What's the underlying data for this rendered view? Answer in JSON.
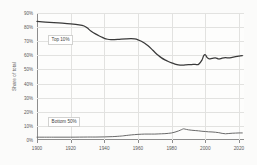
{
  "chart_data": {
    "type": "line",
    "title": "",
    "subtitle": "",
    "xlabel": "",
    "ylabel": "Share of total",
    "xlim": [
      1900,
      2023
    ],
    "ylim": [
      0,
      90
    ],
    "grid": true,
    "legend_position": "inline-annotation",
    "x_ticks": [
      "1900",
      "1920",
      "1940",
      "1960",
      "1980",
      "2000",
      "2020"
    ],
    "x_tick_values": [
      1900,
      1920,
      1940,
      1960,
      1980,
      2000,
      2020
    ],
    "y_ticks": [
      "0%",
      "10%",
      "20%",
      "30%",
      "40%",
      "50%",
      "60%",
      "70%",
      "80%",
      "90%"
    ],
    "y_tick_values": [
      0,
      10,
      20,
      30,
      40,
      50,
      60,
      70,
      80,
      90
    ],
    "annotations": [
      {
        "text": "Top 10%",
        "series": "Top 10%"
      },
      {
        "text": "Bottom 50%",
        "series": "Bottom 50%"
      }
    ],
    "series": [
      {
        "name": "Top 10%",
        "color": "#3a3a3a",
        "x": [
          1900,
          1905,
          1910,
          1915,
          1920,
          1925,
          1928,
          1930,
          1932,
          1935,
          1938,
          1940,
          1942,
          1944,
          1946,
          1948,
          1950,
          1953,
          1956,
          1958,
          1960,
          1962,
          1964,
          1966,
          1968,
          1970,
          1972,
          1974,
          1976,
          1978,
          1980,
          1982,
          1984,
          1986,
          1988,
          1990,
          1992,
          1994,
          1996,
          1998,
          1999,
          2000,
          2001,
          2002,
          2004,
          2006,
          2008,
          2010,
          2012,
          2014,
          2016,
          2018,
          2020,
          2022
        ],
        "values": [
          84.0,
          83.6,
          83.2,
          82.8,
          82.3,
          81.6,
          80.8,
          79.3,
          77.2,
          75.0,
          73.2,
          72.0,
          71.4,
          71.2,
          71.2,
          71.3,
          71.5,
          71.7,
          71.8,
          71.6,
          71.0,
          70.0,
          68.6,
          66.8,
          64.6,
          62.2,
          60.0,
          58.2,
          56.8,
          55.6,
          54.6,
          53.8,
          53.2,
          53.0,
          53.2,
          53.4,
          53.5,
          53.6,
          53.6,
          56.6,
          59.6,
          60.4,
          58.6,
          57.6,
          57.8,
          58.2,
          57.4,
          58.0,
          58.3,
          58.2,
          58.6,
          59.0,
          59.4,
          59.8
        ]
      },
      {
        "name": "Bottom 50%",
        "color": "#6a6a6a",
        "x": [
          1900,
          1910,
          1920,
          1930,
          1935,
          1940,
          1945,
          1950,
          1953,
          1956,
          1958,
          1960,
          1962,
          1964,
          1966,
          1968,
          1970,
          1972,
          1974,
          1976,
          1978,
          1980,
          1982,
          1984,
          1986,
          1987,
          1988,
          1990,
          1992,
          1994,
          1996,
          1998,
          2000,
          2002,
          2004,
          2006,
          2008,
          2010,
          2012,
          2014,
          2016,
          2018,
          2020,
          2022
        ],
        "values": [
          2.0,
          2.0,
          2.0,
          2.1,
          2.1,
          2.2,
          2.4,
          2.8,
          3.2,
          3.6,
          3.8,
          4.0,
          4.1,
          4.2,
          4.2,
          4.2,
          4.2,
          4.3,
          4.4,
          4.5,
          4.7,
          5.0,
          5.6,
          6.4,
          7.4,
          7.9,
          7.7,
          7.2,
          6.9,
          6.7,
          6.5,
          6.2,
          6.0,
          5.8,
          5.7,
          5.5,
          5.2,
          4.7,
          4.4,
          4.6,
          4.8,
          4.9,
          5.0,
          5.0
        ]
      }
    ]
  }
}
